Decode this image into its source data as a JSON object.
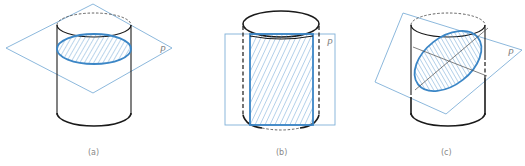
{
  "figure": {
    "colors": {
      "plane": "#7fb0d8",
      "section": "#3b86c6",
      "outline": "#1a1a1a",
      "label": "#888888"
    },
    "panels": [
      {
        "id": "a",
        "caption": "(a)",
        "plane_label": "P",
        "section_shape": "circle",
        "cut": "perpendicular to axis"
      },
      {
        "id": "b",
        "caption": "(b)",
        "plane_label": "P",
        "section_shape": "rectangle",
        "cut": "parallel to axis"
      },
      {
        "id": "c",
        "caption": "(c)",
        "plane_label": "P",
        "section_shape": "ellipse",
        "cut": "oblique to axis"
      }
    ]
  }
}
